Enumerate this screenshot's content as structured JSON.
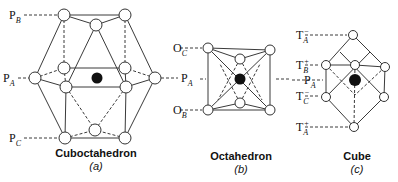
{
  "figures": [
    {
      "id": "a",
      "name": "Cuboctahedron",
      "letter": "(a)",
      "labels": [
        {
          "base": "P",
          "sub": "B"
        },
        {
          "base": "P",
          "sub": "A"
        },
        {
          "base": "P",
          "sub": "C"
        }
      ]
    },
    {
      "id": "b",
      "name": "Octahedron",
      "letter": "(b)",
      "labels": [
        {
          "base": "O",
          "sub": "C"
        },
        {
          "base": "P",
          "sub": "A"
        },
        {
          "base": "O",
          "sub": "B"
        }
      ]
    },
    {
      "id": "c",
      "name": "Cube",
      "letter": "(c)",
      "labels": [
        {
          "base": "T",
          "sub": "A",
          "sup": "−"
        },
        {
          "base": "T",
          "sub": "B",
          "sup": "+"
        },
        {
          "base": "P",
          "sub": "A"
        },
        {
          "base": "T",
          "sub": "C",
          "sup": "−"
        },
        {
          "base": "T",
          "sub": "A",
          "sup": "+"
        }
      ]
    }
  ],
  "colors": {
    "line": "#333333",
    "node_fill": "#ffffff",
    "center_atom": "#111111"
  }
}
